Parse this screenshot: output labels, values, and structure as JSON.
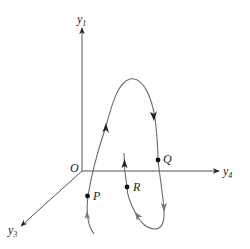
{
  "diagram": {
    "type": "phase-space trajectory",
    "axes": [
      {
        "id": "y1",
        "label": "y",
        "subscript": "1",
        "direction": "up"
      },
      {
        "id": "y4",
        "label": "y",
        "subscript": "4",
        "direction": "right"
      },
      {
        "id": "y3",
        "label": "y",
        "subscript": "3",
        "direction": "down-left"
      }
    ],
    "origin": {
      "label": "O"
    },
    "points": [
      {
        "id": "P",
        "label": "P"
      },
      {
        "id": "Q",
        "label": "Q"
      },
      {
        "id": "R",
        "label": "R"
      }
    ],
    "colors": {
      "axis": "#555555",
      "curve": "#6b6b6b",
      "text": "#222222"
    }
  }
}
